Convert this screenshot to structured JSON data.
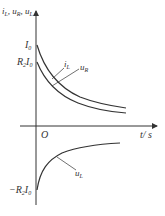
{
  "diagram": {
    "y_axis_label": "i_L, u_R, u_L",
    "y_axis_label_parts": {
      "i": "i",
      "iL": "L",
      "u1": "u",
      "uR": "R",
      "u2": "u",
      "uL": "L"
    },
    "x_axis_label": "t / s",
    "x_axis_parts": {
      "t": "t",
      "unit": "/ s"
    },
    "origin_label": "O",
    "ticks": {
      "I0": {
        "main": "I",
        "sub": "0"
      },
      "R2I0": {
        "R": "R",
        "Rsub": "2",
        "I": "I",
        "Isub": "0"
      },
      "negR2I0": {
        "minus": "−",
        "R": "R",
        "Rsub": "2",
        "I": "I",
        "Isub": "0"
      }
    },
    "curves": [
      {
        "name": "i_L",
        "label_main": "i",
        "label_sub": "L",
        "start": "I0",
        "behavior": "exponential decay to 0"
      },
      {
        "name": "u_R",
        "label_main": "u",
        "label_sub": "R",
        "start": "R2I0",
        "behavior": "exponential decay to 0"
      },
      {
        "name": "u_L",
        "label_main": "u",
        "label_sub": "L",
        "start": "-R2I0",
        "behavior": "exponential rise to 0"
      }
    ],
    "line_color": "#333333"
  }
}
